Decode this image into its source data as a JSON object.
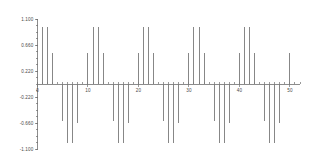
{
  "chart_data": {
    "type": "bar",
    "subtype": "stem-impulse",
    "title": "",
    "subtitle": "",
    "xlabel": "",
    "ylabel": "",
    "grid": false,
    "legend": null,
    "xlim": [
      0,
      52
    ],
    "ylim": [
      -1.1,
      1.1
    ],
    "y_ticks": [
      1.1,
      0.66,
      0.22,
      -0.22,
      -0.66,
      -1.1
    ],
    "y_tick_labels": [
      "1.100",
      "0.660",
      "0.220",
      "-0.220",
      "-0.660",
      "-1.100"
    ],
    "x_ticks": [
      0,
      10,
      20,
      30,
      40,
      50
    ],
    "x_tick_labels": [
      "0",
      "10",
      "20",
      "30",
      "40",
      "50"
    ],
    "series_name": "impulse",
    "stem_color": "#7a7a7a",
    "axis_color": "#6f6f6f",
    "text_color": "#4a4a4a",
    "background_color": "#ffffff",
    "x": [
      0,
      1,
      2,
      3,
      4,
      5,
      6,
      7,
      8,
      9,
      10,
      11,
      12,
      13,
      14,
      15,
      16,
      17,
      18,
      19,
      20,
      21,
      22,
      23,
      24,
      25,
      26,
      27,
      28,
      29,
      30,
      31,
      32,
      33,
      34,
      35,
      36,
      37,
      38,
      39,
      40,
      41,
      42,
      43,
      44,
      45,
      46,
      47,
      48,
      49,
      50,
      51,
      52
    ],
    "values": [
      0.0,
      0.96,
      0.96,
      0.52,
      0.0,
      -0.62,
      -1.0,
      -1.0,
      -0.66,
      0.0,
      0.52,
      0.96,
      0.96,
      0.52,
      0.0,
      -0.62,
      -1.0,
      -1.0,
      -0.66,
      0.0,
      0.52,
      0.96,
      0.96,
      0.52,
      0.0,
      -0.62,
      -1.0,
      -1.0,
      -0.66,
      0.0,
      0.52,
      0.96,
      0.96,
      0.52,
      0.0,
      -0.62,
      -1.0,
      -1.0,
      -0.66,
      0.0,
      0.52,
      0.96,
      0.96,
      0.52,
      0.0,
      -0.62,
      -1.0,
      -1.0,
      -0.66,
      0.0,
      0.52,
      0.0,
      0.0
    ]
  }
}
